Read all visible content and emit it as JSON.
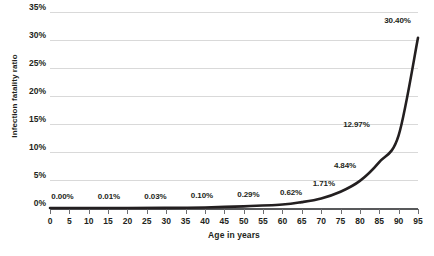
{
  "chart_data": {
    "type": "line",
    "title": "",
    "subtitle": "",
    "xlabel": "Age in years",
    "ylabel": "Infection fatality ratio",
    "xlim": [
      0,
      95
    ],
    "ylim": [
      0,
      35
    ],
    "grid": true,
    "legend": null,
    "y_tick_labels": [
      "35%",
      "30%",
      "25%",
      "20%",
      "15%",
      "10%",
      "5%",
      "0%"
    ],
    "y_tick_values": [
      35,
      30,
      25,
      20,
      15,
      10,
      5,
      0
    ],
    "x_tick_labels": [
      "0",
      "5",
      "10",
      "15",
      "20",
      "25",
      "30",
      "35",
      "40",
      "45",
      "50",
      "55",
      "60",
      "65",
      "70",
      "75",
      "80",
      "85",
      "90",
      "95"
    ],
    "x_tick_values": [
      0,
      5,
      10,
      15,
      20,
      25,
      30,
      35,
      40,
      45,
      50,
      55,
      60,
      65,
      70,
      75,
      80,
      85,
      90,
      95
    ],
    "series": [
      {
        "name": "Infection fatality ratio",
        "color": "#231f20",
        "x": [
          0,
          10,
          20,
          30,
          40,
          50,
          60,
          65,
          70,
          75,
          80,
          85,
          90,
          95
        ],
        "values": [
          0.0,
          0.0,
          0.01,
          0.03,
          0.1,
          0.29,
          0.62,
          1.05,
          1.71,
          2.9,
          4.84,
          8.2,
          12.97,
          30.4
        ]
      }
    ],
    "annotations": [
      {
        "label": "0.00%",
        "x": 5,
        "y": 0.0
      },
      {
        "label": "0.01%",
        "x": 17,
        "y": 0.01
      },
      {
        "label": "0.03%",
        "x": 29,
        "y": 0.03
      },
      {
        "label": "0.10%",
        "x": 41,
        "y": 0.1
      },
      {
        "label": "0.29%",
        "x": 53,
        "y": 0.29
      },
      {
        "label": "0.62%",
        "x": 64,
        "y": 0.62
      },
      {
        "label": "1.71%",
        "x": 73,
        "y": 1.71
      },
      {
        "label": "4.84%",
        "x": 80,
        "y": 4.84
      },
      {
        "label": "12.97%",
        "x": 86,
        "y": 12.97
      },
      {
        "label": "30.40%",
        "x": 93,
        "y": 30.4
      }
    ]
  },
  "colors": {
    "curve": "#231f20",
    "gridline": "#d9d9d9",
    "axis": "#58595b",
    "text": "#231f20",
    "background": "#ffffff"
  }
}
